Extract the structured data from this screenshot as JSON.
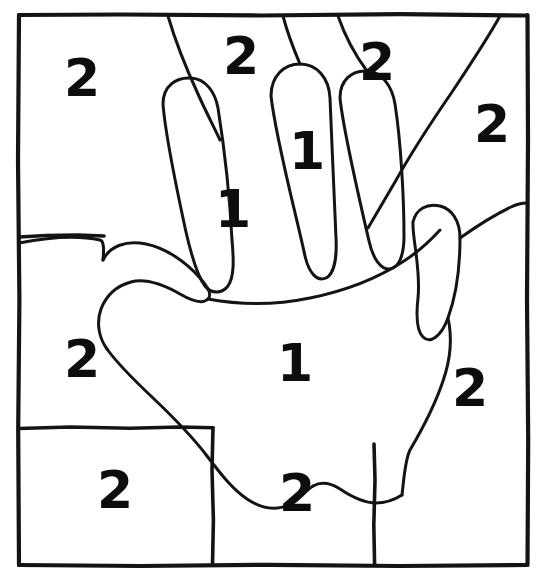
{
  "figure": {
    "background_color": "#ffffff",
    "ink_color": "#141414",
    "label_color": "#0d0d0d",
    "width": 542,
    "height": 580
  },
  "frame": {
    "name": "outer-border",
    "left": 18,
    "top": 14,
    "right": 528,
    "bottom": 566
  },
  "labels": [
    {
      "id": "label-top-left",
      "value": "2",
      "x": 82,
      "y": 82,
      "size": 52,
      "region": "upper-left-background"
    },
    {
      "id": "label-top-mid",
      "value": "2",
      "x": 241,
      "y": 60,
      "size": 52,
      "region": "between-index-and-middle-background"
    },
    {
      "id": "label-top-right",
      "value": "2",
      "x": 377,
      "y": 66,
      "size": 52,
      "region": "between-middle-and-ring-background"
    },
    {
      "id": "label-far-right",
      "value": "2",
      "x": 492,
      "y": 128,
      "size": 52,
      "region": "upper-right-background"
    },
    {
      "id": "label-index-finger",
      "value": "1",
      "x": 233,
      "y": 213,
      "size": 52,
      "region": "index-finger"
    },
    {
      "id": "label-middle-finger",
      "value": "1",
      "x": 307,
      "y": 155,
      "size": 52,
      "region": "middle-finger"
    },
    {
      "id": "label-palm",
      "value": "1",
      "x": 295,
      "y": 367,
      "size": 52,
      "region": "palm"
    },
    {
      "id": "label-mid-left",
      "value": "2",
      "x": 82,
      "y": 363,
      "size": 52,
      "region": "middle-left-background"
    },
    {
      "id": "label-mid-right",
      "value": "2",
      "x": 470,
      "y": 392,
      "size": 52,
      "region": "middle-right-background"
    },
    {
      "id": "label-bottom-left",
      "value": "2",
      "x": 115,
      "y": 494,
      "size": 52,
      "region": "bottom-left-background"
    },
    {
      "id": "label-bottom-mid",
      "value": "2",
      "x": 297,
      "y": 497,
      "size": 52,
      "region": "bottom-centre-wrist"
    }
  ],
  "counts": {
    "total_labels": 11,
    "ones": 3,
    "twos": 8
  },
  "grid_lines": [
    {
      "id": "divider-left-upper",
      "orientation": "horizontal",
      "x1": 19,
      "y1": 237,
      "x2": 106,
      "y2": 235
    },
    {
      "id": "divider-left-lower",
      "orientation": "horizontal",
      "x1": 19,
      "y1": 428,
      "x2": 213,
      "y2": 427
    },
    {
      "id": "divider-bottom-left",
      "orientation": "vertical",
      "x1": 213,
      "y1": 427,
      "x2": 213,
      "y2": 565
    },
    {
      "id": "divider-bottom-right",
      "orientation": "vertical",
      "x1": 374,
      "y1": 444,
      "x2": 375,
      "y2": 565
    }
  ],
  "hand_outline": {
    "name": "hand-silhouette",
    "strokes": [
      "thumb-and-palm-left",
      "index-finger-outline",
      "middle-finger-outline",
      "ring-finger-outline",
      "little-finger-and-right-palm",
      "palm-base-and-wrist"
    ]
  }
}
